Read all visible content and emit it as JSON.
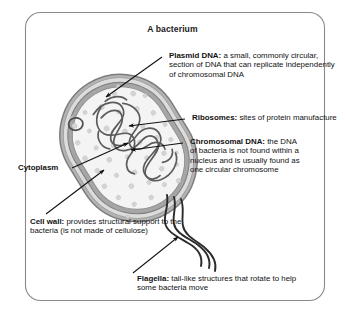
{
  "diagram": {
    "title": "A bacterium",
    "frame": {
      "shape": "rounded-rectangle"
    },
    "colors": {
      "frame_stroke": "#8a8a8a",
      "cell_wall_outer": "#9a9a9a",
      "cell_wall_mid": "#d6d6d6",
      "cell_membrane": "#9a9a9a",
      "cytoplasm": "#f2f2f2",
      "ribosome_dot": "#d2d2d2",
      "dna_stroke": "#5a5a5a",
      "flagella_stroke": "#2b2b2b",
      "leader_line": "#111111",
      "text": "#121212"
    },
    "labels": [
      {
        "id": "plasmid-dna",
        "term": "Plasmid DNA:",
        "description": "a small, commonly circular, section of DNA that can replicate independently of chromosomal DNA",
        "lines": [
          "a small, commonly",
          "circular, section of DNA that can",
          "replicate independently of",
          "chromosomal DNA"
        ],
        "pointer": "arrow"
      },
      {
        "id": "ribosomes",
        "term": "Ribosomes:",
        "description": "sites of protein manufacture",
        "lines": [
          "sites of",
          "protein manufacture"
        ],
        "pointer": "arrow"
      },
      {
        "id": "chromosomal-dna",
        "term": "Chromosomal DNA:",
        "description": "the DNA of bacteria is not found within a nucleus and is usually found as one circular chromosome",
        "lines": [
          "the DNA of bacteria is",
          "not found within",
          "a nucleus and is",
          "usually found as one",
          "circular chromosome"
        ],
        "pointer": "arrow"
      },
      {
        "id": "cytoplasm",
        "term": "Cytoplasm",
        "description": "",
        "lines": [],
        "pointer": "line"
      },
      {
        "id": "cell-wall",
        "term": "Cell wall:",
        "description": "provides structural support to the bacteria (is not made of cellulose)",
        "lines": [
          "provides structural",
          "support to the bacteria (is not",
          "made of cellulose)"
        ],
        "pointer": "arrow"
      },
      {
        "id": "flagella",
        "term": "Flagella:",
        "description": "tail-like structures that rotate to help some bacteria move",
        "lines": [
          "tail-like structures that",
          "rotate to help some bacteria move"
        ],
        "pointer": "arrow"
      }
    ],
    "structures": [
      {
        "name": "cell-wall",
        "shape": "capsule-outline"
      },
      {
        "name": "cell-membrane",
        "shape": "capsule-outline"
      },
      {
        "name": "cytoplasm",
        "shape": "capsule-fill"
      },
      {
        "name": "plasmid-dna",
        "shape": "small-circle"
      },
      {
        "name": "chromosomal-dna",
        "shape": "tangled-loop"
      },
      {
        "name": "ribosomes",
        "shape": "scattered-dots"
      },
      {
        "name": "flagella",
        "shape": "wavy-tails",
        "count": 3
      }
    ]
  }
}
